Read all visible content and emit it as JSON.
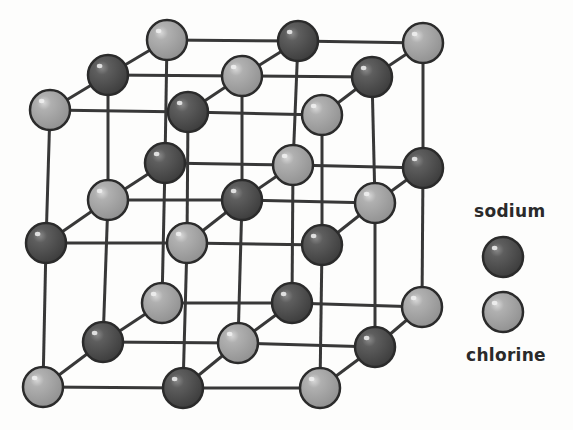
{
  "diagram": {
    "colors": {
      "sodium_fill": "#555555",
      "sodium_dark": "#3a3a3a",
      "chlorine_fill": "#a9a9a9",
      "chlorine_dark": "#8a8a8a",
      "outline": "#2b2b2b",
      "bond": "#383838"
    },
    "atom_radius": 20,
    "lattice": {
      "size": [
        3,
        3,
        3
      ],
      "species_rule": "chlorine when (i+j+k) even, sodium when odd",
      "positions": [
        [
          [
            [
              50,
              110
            ],
            [
              108,
              75
            ],
            [
              167,
              40
            ]
          ],
          [
            [
              46,
              243
            ],
            [
              108,
              200
            ],
            [
              165,
              163
            ]
          ],
          [
            [
              43,
              387
            ],
            [
              103,
              342
            ],
            [
              162,
              303
            ]
          ]
        ],
        [
          [
            [
              188,
              112
            ],
            [
              242,
              76
            ],
            [
              298,
              41
            ]
          ],
          [
            [
              187,
              243
            ],
            [
              242,
              200
            ],
            [
              293,
              165
            ]
          ],
          [
            [
              183,
              388
            ],
            [
              238,
              343
            ],
            [
              292,
              303
            ]
          ]
        ],
        [
          [
            [
              322,
              115
            ],
            [
              372,
              77
            ],
            [
              423,
              43
            ]
          ],
          [
            [
              322,
              245
            ],
            [
              375,
              203
            ],
            [
              423,
              168
            ]
          ],
          [
            [
              320,
              388
            ],
            [
              375,
              347
            ],
            [
              422,
              307
            ]
          ]
        ]
      ]
    }
  },
  "legend": {
    "items": [
      {
        "label": "sodium",
        "species": "sodium"
      },
      {
        "label": "chlorine",
        "species": "chlorine"
      }
    ]
  }
}
